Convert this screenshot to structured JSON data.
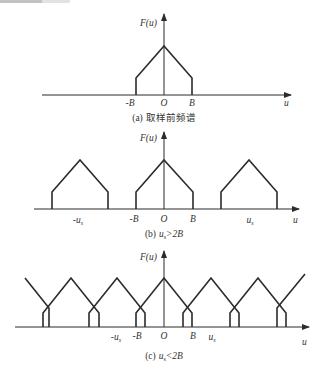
{
  "figure": {
    "top_fragment": "",
    "colors": {
      "stroke": "#2b2b2b",
      "text": "#333333",
      "background": "#ffffff"
    },
    "panels": [
      {
        "id": "a",
        "y_axis_label": "F(u)",
        "x_axis_label": "u",
        "tick_labels": [
          "-B",
          "O",
          "B"
        ],
        "caption_prefix": "(a)",
        "caption_text": "取样前频谱"
      },
      {
        "id": "b",
        "y_axis_label": "F(u)",
        "x_axis_label": "u",
        "tick_labels": [
          "-u",
          "-B",
          "O",
          "B",
          "u"
        ],
        "subscript": "s",
        "caption_prefix": "(b)",
        "caption_text": "u",
        "caption_sub": "s",
        "caption_rel": ">2B"
      },
      {
        "id": "c",
        "y_axis_label": "F(u)",
        "x_axis_label": "u",
        "tick_labels": [
          "-u",
          "-B",
          "O",
          "B",
          "u"
        ],
        "subscript": "s",
        "caption_prefix": "(c)",
        "caption_text": "u",
        "caption_sub": "s",
        "caption_rel": "<2B"
      }
    ]
  }
}
